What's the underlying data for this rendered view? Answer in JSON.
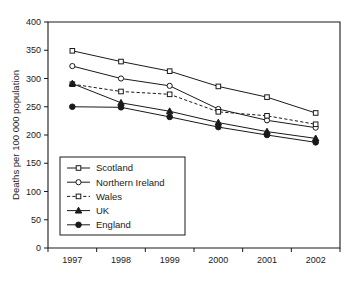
{
  "chart_data": {
    "type": "line",
    "title": "",
    "xlabel": "",
    "ylabel": "Deaths per 100 000 population",
    "categories": [
      "1997",
      "1998",
      "1999",
      "2000",
      "2001",
      "2002"
    ],
    "x": [
      1997,
      1998,
      1999,
      2000,
      2001,
      2002
    ],
    "ylim": [
      0,
      400
    ],
    "yticks": [
      0,
      50,
      100,
      150,
      200,
      250,
      300,
      350,
      400
    ],
    "ytick_labels": [
      "0",
      "50",
      "100",
      "150",
      "200",
      "250",
      "300",
      "350",
      "400"
    ],
    "grid": false,
    "legend_position": "lower-left-inside",
    "series": [
      {
        "name": "Scotland",
        "marker": "open-square",
        "line_style": "solid",
        "values": [
          349,
          330,
          313,
          286,
          267,
          239
        ]
      },
      {
        "name": "Northern Ireland",
        "marker": "open-circle",
        "line_style": "solid",
        "values": [
          322,
          300,
          287,
          246,
          226,
          213
        ]
      },
      {
        "name": "Wales",
        "marker": "open-square",
        "line_style": "dashed",
        "values": [
          290,
          277,
          272,
          241,
          234,
          219
        ]
      },
      {
        "name": "UK",
        "marker": "filled-triangle",
        "line_style": "solid",
        "values": [
          291,
          257,
          242,
          222,
          206,
          194
        ]
      },
      {
        "name": "England",
        "marker": "filled-circle",
        "line_style": "solid",
        "values": [
          250,
          249,
          232,
          214,
          200,
          187
        ]
      }
    ]
  },
  "axes": {
    "y_axis_title": "Deaths per 100 000 population",
    "x_tick_labels": [
      "1997",
      "1998",
      "1999",
      "2000",
      "2001",
      "2002"
    ],
    "y_tick_labels": [
      "400",
      "350",
      "300",
      "250",
      "200",
      "150",
      "100",
      "50",
      "0"
    ]
  },
  "legend": {
    "entries": [
      {
        "label": "Scotland"
      },
      {
        "label": "Northern Ireland"
      },
      {
        "label": "Wales"
      },
      {
        "label": "UK"
      },
      {
        "label": "England"
      }
    ]
  },
  "colors": {
    "ink": "#1a1a1a",
    "background": "#ffffff",
    "marker_fill_open": "#ffffff",
    "marker_fill_solid": "#1a1a1a"
  }
}
